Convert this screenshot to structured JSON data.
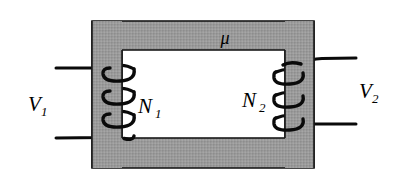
{
  "figure": {
    "type": "transformer-diagram",
    "background_color": "#ffffff",
    "core": {
      "name": "magnetic-core",
      "fill_color": "#969696",
      "stroke_color": "#1a1a1a",
      "outer": {
        "x": 92,
        "y": 21,
        "width": 222,
        "height": 147
      },
      "window": {
        "x": 122,
        "y": 50,
        "width": 163,
        "height": 88
      },
      "permeability_label": "μ"
    },
    "labels": {
      "primary_voltage": {
        "base": "V",
        "sub": "1"
      },
      "secondary_voltage": {
        "base": "V",
        "sub": "2"
      },
      "primary_turns": {
        "base": "N",
        "sub": "1"
      },
      "secondary_turns": {
        "base": "N",
        "sub": "2"
      },
      "permeability": "μ"
    },
    "windings": {
      "primary": {
        "name": "primary-winding",
        "turns_drawn": 3,
        "side": "left",
        "stroke_color": "#0a0a0a"
      },
      "secondary": {
        "name": "secondary-winding",
        "turns_drawn": 3,
        "side": "right",
        "stroke_color": "#0a0a0a"
      }
    },
    "leads": {
      "primary_top": {
        "x1": 56,
        "y1": 68,
        "x2": 108,
        "y2": 68
      },
      "primary_bottom": {
        "x1": 56,
        "y1": 138,
        "x2": 112,
        "y2": 136
      },
      "secondary_top": {
        "x1": 299,
        "y1": 60,
        "x2": 356,
        "y2": 58
      },
      "secondary_bottom": {
        "x1": 299,
        "y1": 124,
        "x2": 356,
        "y2": 124
      }
    }
  }
}
